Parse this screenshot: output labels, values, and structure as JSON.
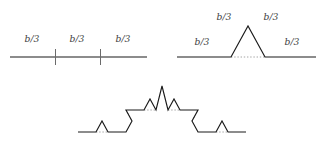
{
  "figure": {
    "name": "koch-curve-construction",
    "width": 324,
    "height": 147,
    "background_color": "#ffffff",
    "line_color": "#1a1a1a",
    "tick_color": "#6b6b6b",
    "dotted_color": "#9a9a9a",
    "label_color": "#3d3d3d"
  },
  "labels": {
    "segment_third": "b/3"
  },
  "panels": [
    {
      "id": "panel-divided-segment",
      "name": "initiator-divided-into-thirds",
      "description": "straight horizontal line divided into three equal parts by two tick marks",
      "labels": [
        {
          "text": "b/3",
          "x": 32,
          "y": 42
        },
        {
          "text": "b/3",
          "x": 77,
          "y": 42
        },
        {
          "text": "b/3",
          "x": 123,
          "y": 42
        }
      ]
    },
    {
      "id": "panel-generator",
      "name": "generator-with-triangular-bump",
      "description": "line with the middle third replaced by two sides of an equilateral triangle",
      "labels": [
        {
          "text": "b/3",
          "x": 202,
          "y": 45
        },
        {
          "text": "b/3",
          "x": 224,
          "y": 20
        },
        {
          "text": "b/3",
          "x": 271,
          "y": 20
        },
        {
          "text": "b/3",
          "x": 292,
          "y": 45
        }
      ]
    },
    {
      "id": "panel-second-iteration",
      "name": "second-iteration-koch-curve",
      "description": "Koch curve after applying the generator to every segment",
      "labels": []
    }
  ],
  "chart_data": {
    "type": "line",
    "title": "",
    "xlabel": "",
    "ylabel": "",
    "grid": false,
    "legend_position": "none",
    "xlim": [
      0,
      324
    ],
    "ylim": [
      147,
      0
    ],
    "series": [
      {
        "name": "panel1-baseline",
        "style": "solid",
        "points": [
          [
            10,
            57
          ],
          [
            147,
            57
          ]
        ]
      },
      {
        "name": "panel1-tick-left",
        "style": "tick",
        "points": [
          [
            55.5,
            49
          ],
          [
            55.5,
            65
          ]
        ]
      },
      {
        "name": "panel1-tick-right",
        "style": "tick",
        "points": [
          [
            100.5,
            49
          ],
          [
            100.5,
            65
          ]
        ]
      },
      {
        "name": "panel2-generator",
        "style": "solid",
        "points": [
          [
            177,
            57
          ],
          [
            231,
            57
          ],
          [
            248,
            26
          ],
          [
            265,
            57
          ],
          [
            316,
            57
          ]
        ]
      },
      {
        "name": "panel2-base-dotted",
        "style": "dotted",
        "points": [
          [
            231,
            57
          ],
          [
            265,
            57
          ]
        ]
      },
      {
        "name": "panel3-koch",
        "style": "solid",
        "points": [
          [
            78,
            132
          ],
          [
            96,
            132
          ],
          [
            102,
            121
          ],
          [
            108,
            132
          ],
          [
            126,
            132
          ],
          [
            132,
            121
          ],
          [
            126,
            110
          ],
          [
            144,
            110
          ],
          [
            150,
            99
          ],
          [
            156,
            110
          ],
          [
            162,
            86
          ],
          [
            168,
            110
          ],
          [
            174,
            99
          ],
          [
            180,
            110
          ],
          [
            198,
            110
          ],
          [
            192,
            121
          ],
          [
            198,
            132
          ],
          [
            216,
            132
          ],
          [
            222,
            121
          ],
          [
            228,
            132
          ],
          [
            246,
            132
          ]
        ]
      },
      {
        "name": "panel3-dotted-bump-1",
        "style": "dotted",
        "points": [
          [
            96,
            132
          ],
          [
            108,
            132
          ]
        ]
      },
      {
        "name": "panel3-dotted-bump-2",
        "style": "dotted",
        "points": [
          [
            126,
            110
          ],
          [
            132,
            121
          ]
        ]
      },
      {
        "name": "panel3-dotted-bump-3",
        "style": "dotted",
        "points": [
          [
            144,
            110
          ],
          [
            156,
            110
          ]
        ]
      },
      {
        "name": "panel3-dotted-bump-4",
        "style": "dotted",
        "points": [
          [
            168,
            110
          ],
          [
            180,
            110
          ]
        ]
      },
      {
        "name": "panel3-dotted-bump-5",
        "style": "dotted",
        "points": [
          [
            192,
            121
          ],
          [
            198,
            110
          ]
        ]
      },
      {
        "name": "panel3-dotted-bump-6",
        "style": "dotted",
        "points": [
          [
            216,
            132
          ],
          [
            228,
            132
          ]
        ]
      }
    ]
  }
}
